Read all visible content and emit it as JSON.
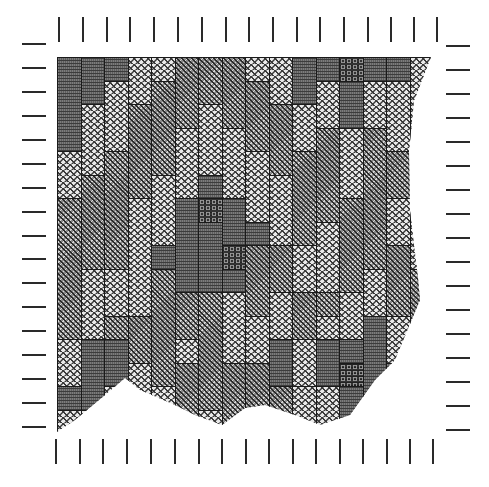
{
  "figure": {
    "texture_legend": {
      "L": {
        "name": "light zigzag",
        "color": "#e9e9e9"
      },
      "M": {
        "name": "medium key",
        "color": "#8a8a8a"
      },
      "D": {
        "name": "dark stripe",
        "color": "#5e5e5e"
      },
      "C": {
        "name": "darkest dot",
        "color": "#333333"
      }
    },
    "grid": {
      "origin_x": 57,
      "origin_y": 57,
      "col_width": 23.5,
      "half_row": 11.75,
      "columns": 16,
      "half_rows": 32
    },
    "outline_polygon": [
      [
        0,
        0
      ],
      [
        374,
        0
      ],
      [
        357,
        44
      ],
      [
        352,
        94
      ],
      [
        353,
        154
      ],
      [
        361,
        221
      ],
      [
        363,
        243
      ],
      [
        338,
        303
      ],
      [
        318,
        323
      ],
      [
        293,
        358
      ],
      [
        263,
        368
      ],
      [
        238,
        358
      ],
      [
        208,
        348
      ],
      [
        188,
        351
      ],
      [
        165,
        368
      ],
      [
        138,
        358
      ],
      [
        118,
        348
      ],
      [
        83,
        333
      ],
      [
        68,
        321
      ],
      [
        48,
        338
      ],
      [
        18,
        363
      ],
      [
        0,
        375
      ]
    ],
    "columns": [
      [
        [
          "D",
          0,
          8
        ],
        [
          "L",
          8,
          4
        ],
        [
          "M",
          12,
          12
        ],
        [
          "L",
          24,
          4
        ],
        [
          "D",
          28,
          2
        ],
        [
          "L",
          30,
          2
        ]
      ],
      [
        [
          "D",
          0,
          4
        ],
        [
          "L",
          4,
          6
        ],
        [
          "M",
          10,
          8
        ],
        [
          "L",
          18,
          6
        ],
        [
          "D",
          24,
          6
        ],
        [
          "L",
          30,
          2
        ]
      ],
      [
        [
          "D",
          0,
          2
        ],
        [
          "L",
          2,
          6
        ],
        [
          "M",
          8,
          10
        ],
        [
          "L",
          18,
          4
        ],
        [
          "M",
          22,
          2
        ],
        [
          "D",
          24,
          4
        ],
        [
          "L",
          28,
          4
        ]
      ],
      [
        [
          "L",
          0,
          4
        ],
        [
          "M",
          4,
          8
        ],
        [
          "L",
          12,
          10
        ],
        [
          "M",
          22,
          4
        ],
        [
          "L",
          26,
          4
        ],
        [
          "M",
          30,
          2
        ]
      ],
      [
        [
          "L",
          0,
          2
        ],
        [
          "M",
          2,
          8
        ],
        [
          "L",
          10,
          6
        ],
        [
          "D",
          16,
          2
        ],
        [
          "M",
          18,
          10
        ],
        [
          "L",
          28,
          2
        ],
        [
          "M",
          30,
          2
        ]
      ],
      [
        [
          "M",
          0,
          6
        ],
        [
          "L",
          6,
          6
        ],
        [
          "D",
          12,
          8
        ],
        [
          "M",
          20,
          4
        ],
        [
          "L",
          24,
          2
        ],
        [
          "M",
          26,
          6
        ]
      ],
      [
        [
          "M",
          0,
          4
        ],
        [
          "L",
          4,
          6
        ],
        [
          "D",
          10,
          2
        ],
        [
          "C",
          12,
          2
        ],
        [
          "D",
          14,
          6
        ],
        [
          "M",
          20,
          10
        ],
        [
          "L",
          30,
          2
        ]
      ],
      [
        [
          "M",
          0,
          6
        ],
        [
          "L",
          6,
          6
        ],
        [
          "D",
          12,
          4
        ],
        [
          "C",
          16,
          2
        ],
        [
          "D",
          18,
          2
        ],
        [
          "L",
          20,
          6
        ],
        [
          "M",
          26,
          6
        ]
      ],
      [
        [
          "L",
          0,
          2
        ],
        [
          "M",
          2,
          6
        ],
        [
          "L",
          8,
          6
        ],
        [
          "D",
          14,
          2
        ],
        [
          "M",
          16,
          6
        ],
        [
          "L",
          22,
          4
        ],
        [
          "M",
          26,
          6
        ]
      ],
      [
        [
          "L",
          0,
          4
        ],
        [
          "M",
          4,
          6
        ],
        [
          "L",
          10,
          6
        ],
        [
          "M",
          16,
          4
        ],
        [
          "L",
          20,
          4
        ],
        [
          "D",
          24,
          4
        ],
        [
          "M",
          28,
          4
        ]
      ],
      [
        [
          "D",
          0,
          4
        ],
        [
          "L",
          4,
          4
        ],
        [
          "M",
          8,
          8
        ],
        [
          "L",
          16,
          4
        ],
        [
          "M",
          20,
          4
        ],
        [
          "L",
          24,
          4
        ],
        [
          "L",
          28,
          4
        ]
      ],
      [
        [
          "D",
          0,
          2
        ],
        [
          "L",
          2,
          4
        ],
        [
          "M",
          6,
          8
        ],
        [
          "L",
          14,
          6
        ],
        [
          "M",
          20,
          2
        ],
        [
          "L",
          22,
          2
        ],
        [
          "D",
          24,
          4
        ],
        [
          "L",
          28,
          4
        ]
      ],
      [
        [
          "C",
          0,
          2
        ],
        [
          "D",
          2,
          4
        ],
        [
          "L",
          6,
          6
        ],
        [
          "M",
          12,
          8
        ],
        [
          "L",
          20,
          4
        ],
        [
          "D",
          24,
          2
        ],
        [
          "C",
          26,
          2
        ],
        [
          "D",
          28,
          4
        ]
      ],
      [
        [
          "D",
          0,
          2
        ],
        [
          "L",
          2,
          4
        ],
        [
          "M",
          6,
          12
        ],
        [
          "L",
          18,
          4
        ],
        [
          "D",
          22,
          8
        ],
        [
          "L",
          30,
          2
        ]
      ],
      [
        [
          "D",
          0,
          2
        ],
        [
          "L",
          2,
          6
        ],
        [
          "M",
          8,
          4
        ],
        [
          "L",
          12,
          4
        ],
        [
          "M",
          16,
          6
        ],
        [
          "L",
          22,
          4
        ],
        [
          "D",
          26,
          6
        ]
      ],
      [
        [
          "L",
          0,
          6
        ],
        [
          "M",
          6,
          8
        ],
        [
          "L",
          14,
          4
        ],
        [
          "M",
          18,
          8
        ],
        [
          "L",
          26,
          6
        ]
      ]
    ],
    "ticks": {
      "top": {
        "y": 17,
        "xs": [
          58,
          82,
          106,
          129,
          153,
          177,
          201,
          225,
          248,
          272,
          296,
          319,
          343,
          367,
          390,
          413,
          436
        ]
      },
      "bottom": {
        "y": 439,
        "xs": [
          55,
          79,
          102,
          126,
          150,
          174,
          198,
          221,
          245,
          268,
          292,
          315,
          339,
          362,
          386,
          409,
          432
        ]
      },
      "left": {
        "x": 22,
        "ys": [
          43,
          67,
          91,
          115,
          139,
          163,
          187,
          211,
          235,
          258,
          282,
          306,
          330,
          354,
          378,
          402,
          426
        ]
      },
      "right": {
        "x": 446,
        "ys": [
          45,
          69,
          93,
          117,
          141,
          165,
          189,
          213,
          237,
          261,
          285,
          309,
          333,
          357,
          381,
          405,
          429
        ]
      }
    }
  }
}
